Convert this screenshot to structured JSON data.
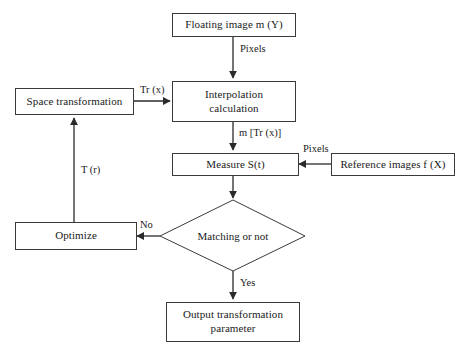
{
  "diagram": {
    "background_color": "#ffffff",
    "line_color": "#3a3a3a",
    "text_color": "#1a1a1a",
    "nodes": {
      "floating_image": "Floating image m (Y)",
      "interpolation": "Interpolation\ncalculation",
      "space_transformation": "Space transformation",
      "measure": "Measure S(t)",
      "reference_images": "Reference images f (X)",
      "optimize": "Optimize",
      "decision": "Matching or not",
      "output": "Output transformation\nparameter"
    },
    "edge_labels": {
      "pixels_top": "Pixels",
      "tr_x": "Tr (x)",
      "m_tr_x": "m [Tr (x)]",
      "pixels_right": "Pixels",
      "t_r": "T (r)",
      "no": "No",
      "yes": "Yes"
    }
  }
}
